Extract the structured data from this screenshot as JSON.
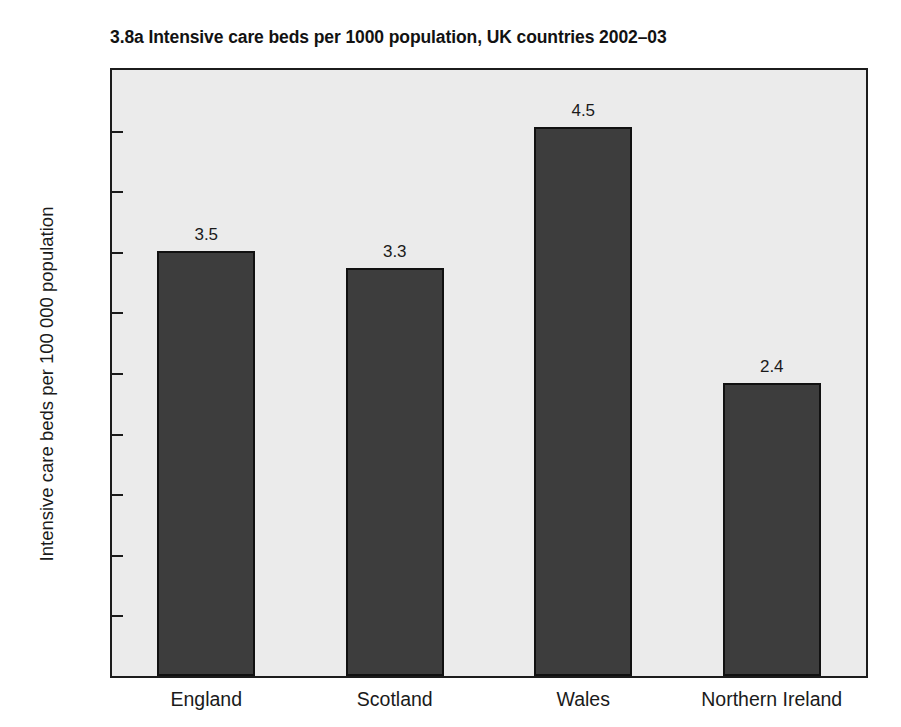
{
  "chart_data": {
    "type": "bar",
    "title": "3.8a  Intensive care beds per 1000 population, UK countries 2002–03",
    "xlabel": "",
    "ylabel": "Intensive care beds per 100 000 population",
    "categories": [
      "England",
      "Scotland",
      "Wales",
      "Northern Ireland"
    ],
    "values": [
      3.5,
      3.3,
      4.5,
      2.4
    ],
    "bar_heights": [
      3.51,
      3.37,
      4.53,
      2.42
    ],
    "data_labels": [
      "3.5",
      "3.3",
      "4.5",
      "2.4"
    ],
    "ylim": [
      0,
      5.0
    ],
    "ytick_values": [
      0,
      0.5,
      1.0,
      1.5,
      2.0,
      2.5,
      3.0,
      3.5,
      4.0,
      4.5,
      5.0
    ],
    "ytick_labels": [
      "0",
      "0.5",
      "1.0",
      "1.5",
      "2.0",
      "2.5",
      "3.0",
      "3.5",
      "4.0",
      "4.5",
      "5.0"
    ],
    "grid": false,
    "legend": null,
    "series": [
      {
        "name": "Intensive care beds per 100 000 population",
        "values": [
          3.5,
          3.3,
          4.5,
          2.4
        ]
      }
    ],
    "colors": {
      "bar_fill": "#3d3d3d",
      "bar_border": "#111111",
      "plot_background": "#ebebeb",
      "axis": "#1c1c1c",
      "page_background": "#ffffff",
      "text": "#1a1a1a"
    }
  }
}
